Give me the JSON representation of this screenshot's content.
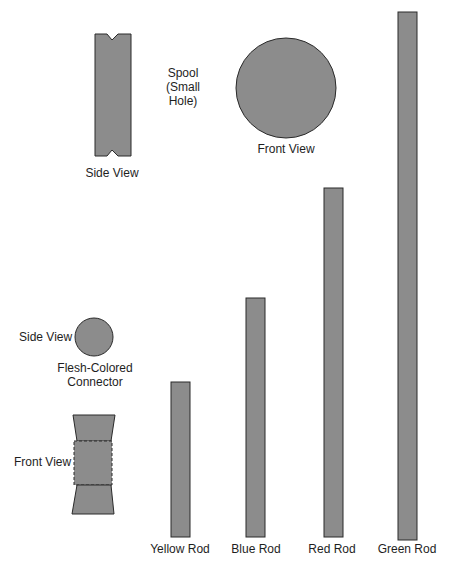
{
  "colors": {
    "fill": "#8c8c8c",
    "stroke": "#2a2a2a",
    "background": "#ffffff"
  },
  "spool": {
    "title": "Spool",
    "subtitle_line1": "(Small",
    "subtitle_line2": "Hole)",
    "side_view_label": "Side View",
    "front_view_label": "Front View"
  },
  "connector": {
    "side_view_label": "Side View",
    "name_line1": "Flesh-Colored",
    "name_line2": "Connector",
    "front_view_label": "Front View"
  },
  "rods": [
    {
      "label": "Yellow Rod",
      "relative_length": 155
    },
    {
      "label": "Blue Rod",
      "relative_length": 239
    },
    {
      "label": "Red Rod",
      "relative_length": 349
    },
    {
      "label": "Green Rod",
      "relative_length": 528
    }
  ]
}
